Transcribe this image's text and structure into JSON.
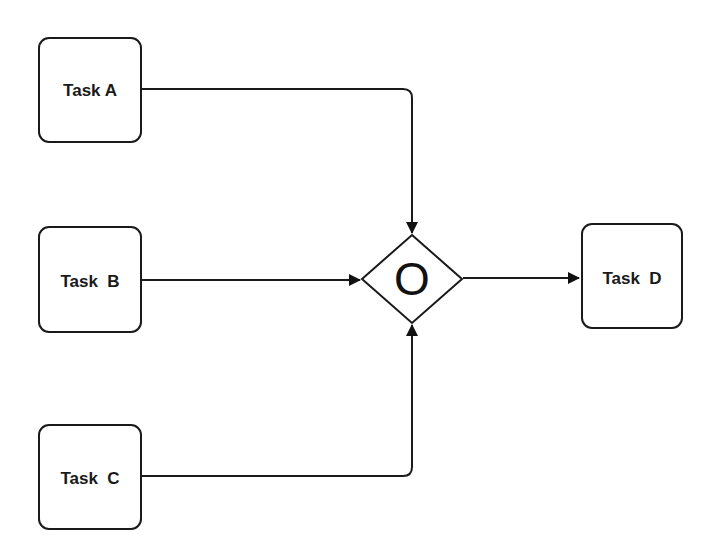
{
  "diagram": {
    "type": "flowchart / BPMN inclusive gateway merge",
    "nodes": {
      "task_a": {
        "label": "Task A"
      },
      "task_b": {
        "label": "Task  B"
      },
      "task_c": {
        "label": "Task  C"
      },
      "task_d": {
        "label": "Task  D"
      },
      "gateway": {
        "symbol": "O",
        "kind": "inclusive-gateway"
      }
    },
    "edges": [
      {
        "from": "Task A",
        "to": "Gateway"
      },
      {
        "from": "Task B",
        "to": "Gateway"
      },
      {
        "from": "Task C",
        "to": "Gateway"
      },
      {
        "from": "Gateway",
        "to": "Task D"
      }
    ],
    "colors": {
      "stroke": "#1a1a1a",
      "background": "#ffffff"
    }
  }
}
